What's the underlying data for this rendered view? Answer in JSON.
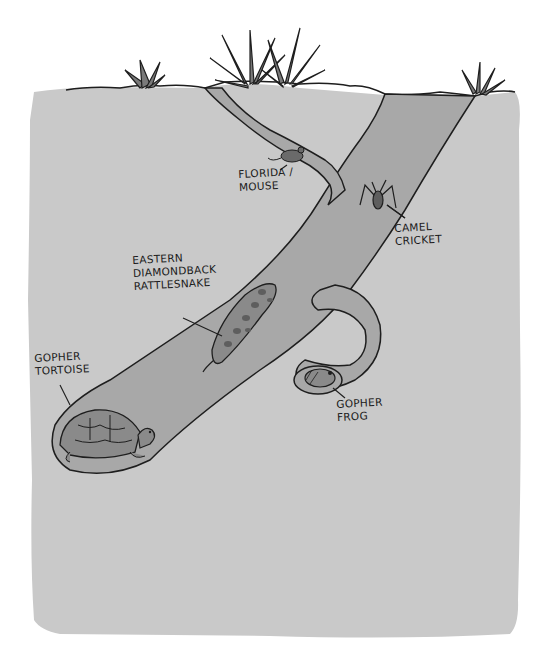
{
  "diagram": {
    "colors": {
      "background": "#ffffff",
      "soil": "#c9c9c9",
      "tunnel": "#a8a8a8",
      "outline": "#1e1e1e",
      "animal_fill": "#8a8a8a",
      "animal_dark": "#5e5e5e"
    },
    "labels": {
      "florida_mouse": "FLORIDA /\nMOUSE",
      "camel_cricket": "CAMEL\nCRICKET",
      "rattlesnake": "EASTERN\nDIAMONDBACK\nRATTLESNAKE",
      "gopher_tortoise": "GOPHER\nTORTOISE",
      "gopher_frog": "GOPHER\nFROG"
    },
    "animals": [
      {
        "name": "Florida Mouse",
        "location": "side tunnel near surface"
      },
      {
        "name": "Camel Cricket",
        "location": "main tunnel wall"
      },
      {
        "name": "Eastern Diamondback Rattlesnake",
        "location": "mid tunnel"
      },
      {
        "name": "Gopher Tortoise",
        "location": "burrow chamber at bottom"
      },
      {
        "name": "Gopher Frog",
        "location": "side pocket chamber"
      }
    ]
  }
}
